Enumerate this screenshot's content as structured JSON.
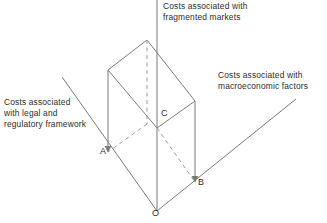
{
  "diagram": {
    "title_alt": "Three-axis cost diagram with shaded box",
    "colors": {
      "line": "#7a7a7a",
      "dashed": "#9a9a9a",
      "text": "#2b2b2b",
      "background": "#ffffff"
    },
    "axes": [
      {
        "id": "vertical-axis",
        "label": "Costs associated with\nfragmented markets"
      },
      {
        "id": "left-axis",
        "label": "Costs associated\nwith legal and\nregulatory framework"
      },
      {
        "id": "right-axis",
        "label": "Costs associated with\nmacroeconomic factors"
      }
    ],
    "vertices": [
      {
        "id": "A",
        "label": "A"
      },
      {
        "id": "B",
        "label": "B"
      },
      {
        "id": "C",
        "label": "C"
      },
      {
        "id": "O",
        "label": "O"
      }
    ]
  }
}
